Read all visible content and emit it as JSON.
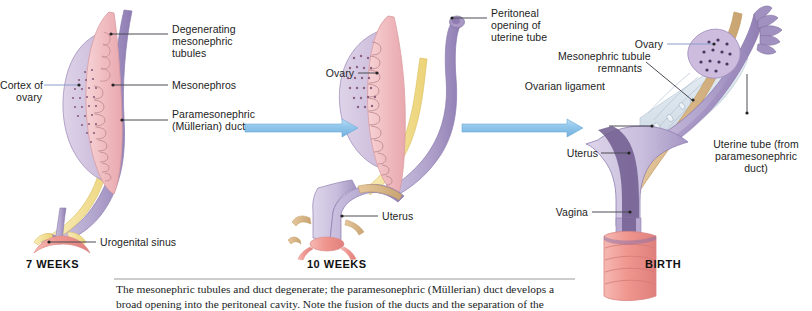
{
  "figure": {
    "type": "diagram",
    "background": "#ffffff"
  },
  "palette": {
    "mesonephros_pink": "#f0bcc0",
    "ovary_lavender": "#cfc0dd",
    "duct_purple": "#b3a6ce",
    "duct_purple_dark": "#7d6aa0",
    "mesonephric_yellow": "#f2dd90",
    "ligament_tan": "#d9b483",
    "mesosalpinx_pale": "#dfe7ee",
    "vagina_pink": "#ef9a95",
    "arrow_blue": "#8fc5ea",
    "arrow_blue_edge": "#6aa9d8",
    "leader_gray": "#4a4a55",
    "leader_blue": "#8d9ccb"
  },
  "panels": [
    {
      "id": "panel-7-weeks",
      "title": "7 WEEKS",
      "labels": [
        {
          "name": "degenerating-mesonephric-tubules",
          "text": "Degenerating\nmesonephric\ntubules",
          "align": "left",
          "leader_color": "gray"
        },
        {
          "name": "mesonephros",
          "text": "Mesonephros",
          "align": "left",
          "leader_color": "gray"
        },
        {
          "name": "paramesonephric-mullerian-duct",
          "text": "Paramesonephric\n(Müllerian) duct",
          "align": "left",
          "leader_color": "gray"
        },
        {
          "name": "cortex-of-ovary",
          "text": "Cortex of\novary",
          "align": "right",
          "leader_color": "blue"
        },
        {
          "name": "urogenital-sinus",
          "text": "Urogenital sinus",
          "align": "left",
          "leader_color": "gray"
        }
      ]
    },
    {
      "id": "panel-10-weeks",
      "title": "10 WEEKS",
      "labels": [
        {
          "name": "peritoneal-opening-of-uterine-tube",
          "text": "Peritoneal\nopening of\nuterine tube",
          "align": "left",
          "leader_color": "gray"
        },
        {
          "name": "ovary",
          "text": "Ovary",
          "align": "right",
          "leader_color": "gray"
        },
        {
          "name": "uterus",
          "text": "Uterus",
          "align": "left",
          "leader_color": "gray"
        }
      ]
    },
    {
      "id": "panel-birth",
      "title": "BIRTH",
      "labels": [
        {
          "name": "ovary",
          "text": "Ovary",
          "align": "right",
          "leader_color": "blue"
        },
        {
          "name": "mesonephric-tubule-remnants",
          "text": "Mesonephric tubule\nremnants",
          "align": "right",
          "leader_color": "gray"
        },
        {
          "name": "ovarian-ligament",
          "text": "Ovarian ligament",
          "align": "right",
          "leader_color": "gray"
        },
        {
          "name": "uterine-tube-from-paramesonephric-duct",
          "text": "Uterine tube (from\nparamesonephric\nduct)",
          "align": "center",
          "leader_color": "gray"
        },
        {
          "name": "uterus",
          "text": "Uterus",
          "align": "right",
          "leader_color": "gray"
        },
        {
          "name": "vagina",
          "text": "Vagina",
          "align": "right",
          "leader_color": "gray"
        }
      ]
    }
  ],
  "arrows": [
    {
      "name": "arrow-7-to-10-weeks",
      "direction": "right"
    },
    {
      "name": "arrow-10-weeks-to-birth",
      "direction": "right"
    }
  ],
  "caption": {
    "line1": "The mesonephric tubules and duct degenerate; the paramesonephric (Müllerian) duct develops a",
    "line2": "broad opening into the peritoneal cavity. Note the fusion of the ducts and the separation of the"
  },
  "label_text": {
    "p1_tubules": "Degenerating\nmesonephric\ntubules",
    "p1_mesonephros": "Mesonephros",
    "p1_duct": "Paramesonephric\n(Müllerian) duct",
    "p1_cortex": "Cortex of\novary",
    "p1_sinus": "Urogenital sinus",
    "p1_title": "7 WEEKS",
    "p2_peritoneal": "Peritoneal\nopening of\nuterine tube",
    "p2_ovary": "Ovary",
    "p2_uterus": "Uterus",
    "p2_title": "10 WEEKS",
    "p3_ovary": "Ovary",
    "p3_remnants": "Mesonephric tubule\nremnants",
    "p3_ligament": "Ovarian ligament",
    "p3_tube": "Uterine tube (from\nparamesonephric\nduct)",
    "p3_uterus": "Uterus",
    "p3_vagina": "Vagina",
    "p3_title": "BIRTH"
  }
}
